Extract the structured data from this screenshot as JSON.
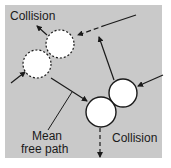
{
  "diagram": {
    "background_color": "#c9c9c9",
    "page_color": "#ffffff",
    "line_color": "#1a1a1a",
    "circle_fill": "#ffffff",
    "labels": {
      "collision_top": "Collision",
      "collision_bottom": "Collision",
      "mean_free_path_line1": "Mean",
      "mean_free_path_line2": "free path"
    },
    "molecules": [
      {
        "id": "upper-left-a",
        "cx": 60,
        "cy": 44,
        "r": 14,
        "style": "dashed"
      },
      {
        "id": "upper-left-b",
        "cx": 37,
        "cy": 64,
        "r": 14,
        "style": "dashed"
      },
      {
        "id": "lower-right-a",
        "cx": 123,
        "cy": 93,
        "r": 14,
        "style": "solid"
      },
      {
        "id": "lower-right-b",
        "cx": 101,
        "cy": 112,
        "r": 15,
        "style": "solid"
      }
    ]
  }
}
